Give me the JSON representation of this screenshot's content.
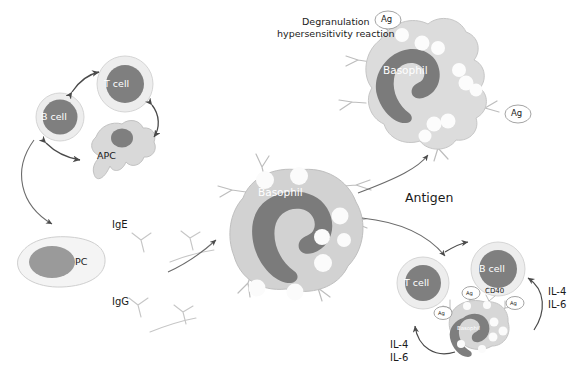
{
  "diagram": {
    "title_lines": [
      "Degranulation",
      "hypersensitivity reaction"
    ],
    "antigen_label": "Antigen",
    "colors": {
      "nucleus": "#7f7f7f",
      "nucleus_dark": "#6e6e6e",
      "cytoplasm": "#cfcfcf",
      "cytoplasm_light": "#e4e4e4",
      "membrane_ring": "#ececec",
      "granule": "#fdfdfd",
      "outline": "#b8b8b8",
      "arrow": "#6b6b6b",
      "text": "#1a1a1a",
      "text_on_cell": "#ffffff"
    },
    "cells": {
      "b_cell_top": {
        "label": "B cell",
        "x": 35,
        "y": 95
      },
      "t_cell_top": {
        "label": "T cell",
        "x": 95,
        "y": 55
      },
      "apc": {
        "label": "APC",
        "x": 85,
        "y": 110
      },
      "pc": {
        "label": "PC",
        "x": 30,
        "y": 240
      },
      "basophil_center": {
        "label": "Basophil",
        "x": 220,
        "y": 160
      },
      "basophil_degranulating": {
        "label": "Basophil",
        "x": 355,
        "y": 15
      },
      "t_cell_bottom": {
        "label": "T cell",
        "x": 395,
        "y": 255
      },
      "b_cell_bottom": {
        "label": "B cell",
        "x": 468,
        "y": 245
      },
      "basophil_small": {
        "label": "Basophil",
        "x": 450,
        "y": 300
      }
    },
    "antibodies": [
      {
        "label": "IgE",
        "x": 112,
        "y": 218
      },
      {
        "label": "IgG",
        "x": 112,
        "y": 295
      }
    ],
    "antigen_tags": [
      {
        "label": "Ag",
        "x": 375,
        "y": 10
      },
      {
        "label": "Ag",
        "x": 505,
        "y": 105
      },
      {
        "label": "Ag",
        "x": 462,
        "y": 288
      },
      {
        "label": "Ag",
        "x": 508,
        "y": 300
      },
      {
        "label": "Ag",
        "x": 438,
        "y": 310
      }
    ],
    "receptor_tags": [
      {
        "label": "CD40",
        "x": 487,
        "y": 291
      }
    ],
    "cytokines": [
      {
        "lines": [
          "IL-4",
          "IL-6"
        ],
        "x": 548,
        "y": 288
      },
      {
        "lines": [
          "IL-4",
          "IL-6"
        ],
        "x": 392,
        "y": 341
      }
    ]
  }
}
